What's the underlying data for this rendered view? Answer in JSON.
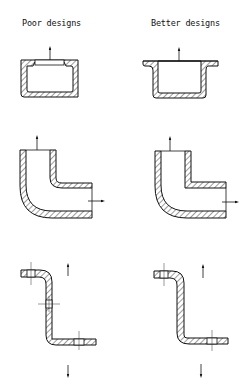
{
  "diagram": {
    "columns": [
      {
        "id": "poor",
        "label": "Poor designs"
      },
      {
        "id": "better",
        "label": "Better designs"
      }
    ],
    "rows": [
      {
        "id": "box",
        "description": "Cast box section with opening",
        "arrows": [
          "up"
        ]
      },
      {
        "id": "elbow",
        "description": "Elbow pipe section",
        "arrows": [
          "up",
          "right"
        ]
      },
      {
        "id": "z-bracket",
        "description": "Z-shaped bracket with holes",
        "arrows": [
          "up",
          "down"
        ]
      }
    ],
    "colors": {
      "stroke": "#111111",
      "background": "#ffffff",
      "hatch": "#222222"
    }
  }
}
